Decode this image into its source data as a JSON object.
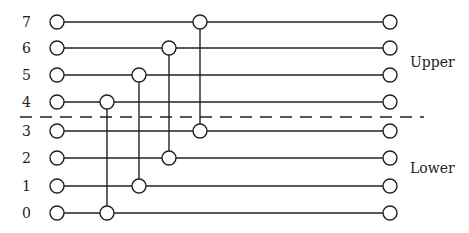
{
  "diagram": {
    "rows": [
      {
        "label": "7",
        "y": 22
      },
      {
        "label": "6",
        "y": 48
      },
      {
        "label": "5",
        "y": 75
      },
      {
        "label": "4",
        "y": 102
      },
      {
        "label": "3",
        "y": 131
      },
      {
        "label": "2",
        "y": 158
      },
      {
        "label": "1",
        "y": 186
      },
      {
        "label": "0",
        "y": 213
      }
    ],
    "connections": [
      {
        "from": "4",
        "to": "0",
        "x": 107
      },
      {
        "from": "5",
        "to": "1",
        "x": 139
      },
      {
        "from": "6",
        "to": "2",
        "x": 169
      },
      {
        "from": "7",
        "to": "3",
        "x": 200
      }
    ],
    "start_x": 57,
    "end_x": 390,
    "divider_y": 117,
    "groups": {
      "upper": "Upper",
      "lower": "Lower"
    }
  }
}
